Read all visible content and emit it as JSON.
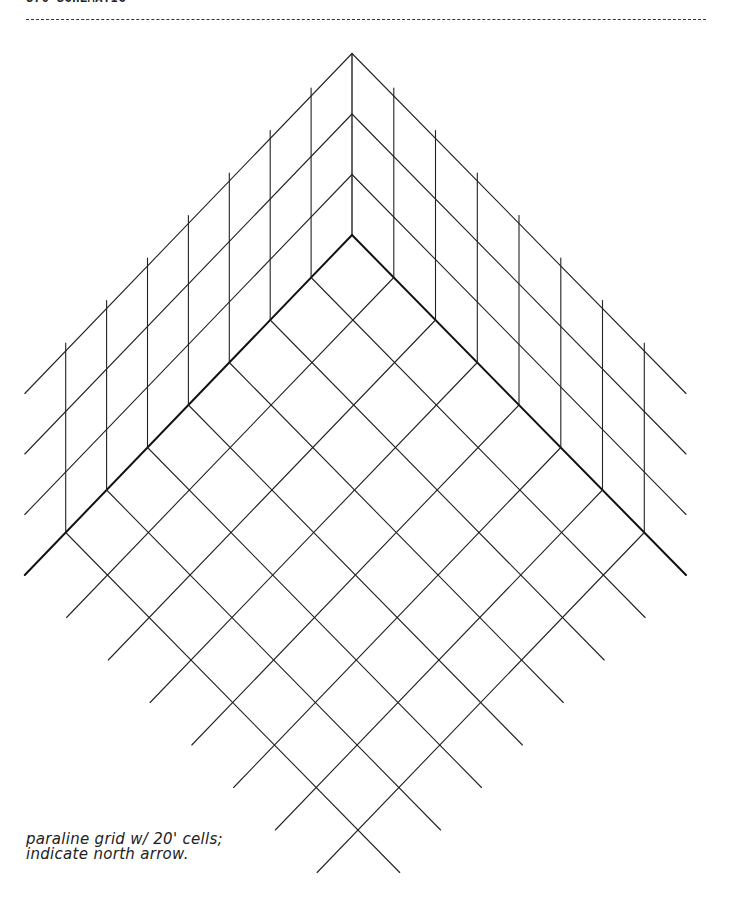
{
  "header": {
    "title": "376 SCHEMATIC"
  },
  "diagram": {
    "type": "paraline-grid",
    "origin": [
      352,
      235
    ],
    "left_step": [
      -40.9,
      42.5
    ],
    "right_step": [
      41.75,
      42.5
    ],
    "cells_per_side": 8,
    "wall_tiers": 3,
    "tier_height": 60.5,
    "post_overhang": 8,
    "line_color": "#222222",
    "base_color": "#111111"
  },
  "note": {
    "line1": "paraline grid w/ 20' cells;",
    "line2": "indicate north arrow."
  }
}
